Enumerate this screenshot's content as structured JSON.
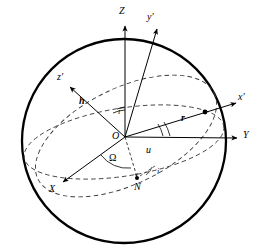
{
  "figure": {
    "background_color": "#ffffff",
    "stroke_color": "#000000",
    "dashed_color": "#3a3a3a",
    "width": 261,
    "height": 251
  },
  "sphere": {
    "name": "celestial-sphere",
    "center_x": 124,
    "center_y": 141,
    "radius": 102,
    "stroke_width": 2.2
  },
  "origin": {
    "label": "O",
    "x": 125,
    "y": 137
  },
  "axes": [
    {
      "id": "Z",
      "label": "Z",
      "label_x": 120,
      "label_y": 8,
      "tip_x": 125,
      "tip_y": 24,
      "style": "solid",
      "italic": true
    },
    {
      "id": "yprime",
      "label": "y′",
      "label_x": 148,
      "label_y": 14,
      "tip_x": 158,
      "tip_y": 26,
      "style": "solid",
      "italic": true
    },
    {
      "id": "xprime",
      "label": "x′",
      "label_x": 238,
      "label_y": 93,
      "tip_x": 237,
      "tip_y": 101,
      "style": "solid",
      "italic": true
    },
    {
      "id": "Y",
      "label": "Y",
      "label_x": 243,
      "label_y": 130,
      "tip_x": 238,
      "tip_y": 138,
      "style": "solid",
      "italic": true
    },
    {
      "id": "X",
      "label": "X",
      "label_x": 50,
      "label_y": 186,
      "tip_x": 62,
      "tip_y": 181,
      "style": "solid",
      "italic": true
    },
    {
      "id": "zprime",
      "label": "z′",
      "label_x": 58,
      "label_y": 74,
      "tip_x": 68,
      "tip_y": 86,
      "style": "solid",
      "italic": true
    }
  ],
  "vectors": [
    {
      "id": "h",
      "label": "h",
      "label_x": 80,
      "label_y": 97,
      "bold": true,
      "description": "angular-momentum vector along z-prime"
    },
    {
      "id": "r",
      "label": "r",
      "label_x": 182,
      "label_y": 115,
      "bold": true,
      "description": "position vector from origin to satellite"
    }
  ],
  "angles": [
    {
      "id": "i-top",
      "label": "i",
      "label_x": 118,
      "label_y": 110,
      "description": "inclination between Z axis and angular momentum"
    },
    {
      "id": "u",
      "label": "u",
      "label_x": 146,
      "label_y": 147,
      "description": "argument of latitude"
    },
    {
      "id": "Omega",
      "label": "Ω",
      "label_x": 110,
      "label_y": 156,
      "upright": true,
      "description": "right ascension of ascending node"
    },
    {
      "id": "i-node",
      "label": "i",
      "label_x": 157,
      "label_y": 172,
      "description": "inclination at ascending node"
    }
  ],
  "points": [
    {
      "id": "N",
      "label": "N",
      "label_x": 135,
      "label_y": 187,
      "dot_x": 137,
      "dot_y": 179,
      "description": "ascending node"
    },
    {
      "id": "satellite",
      "label": "",
      "dot_x": 205,
      "dot_y": 112,
      "description": "satellite position on orbit"
    }
  ],
  "curves": [
    {
      "id": "equatorial-plane",
      "style": "dashed",
      "description": "equatorial plane ellipse through X and Y axes"
    },
    {
      "id": "orbital-plane",
      "style": "dashed",
      "description": "inclined orbital plane ellipse through node N and satellite"
    }
  ]
}
